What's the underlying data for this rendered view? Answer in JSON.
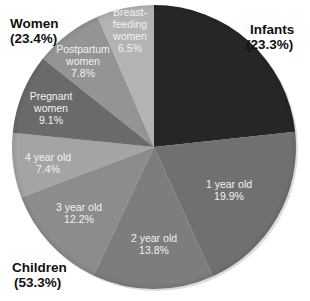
{
  "chart_data": {
    "type": "pie",
    "title": "",
    "start_angle": "12 o'clock, clockwise",
    "slices": [
      {
        "label": "Infants",
        "value": 23.3,
        "color": "#262626",
        "label_lines": [],
        "label_pos": [
          0,
          0
        ]
      },
      {
        "label": "1 year old",
        "value": 19.9,
        "color": "#707070",
        "label_lines": [
          "1 year old",
          "19.9%"
        ],
        "label_pos": [
          229,
          190
        ]
      },
      {
        "label": "2 year old",
        "value": 13.8,
        "color": "#7d7d7d",
        "label_lines": [
          "2 year old",
          "13.8%"
        ],
        "label_pos": [
          154,
          244
        ]
      },
      {
        "label": "3 year old",
        "value": 12.2,
        "color": "#8c8c8c",
        "label_lines": [
          "3 year old",
          "12.2%"
        ],
        "label_pos": [
          79,
          213
        ]
      },
      {
        "label": "4 year old",
        "value": 7.4,
        "color": "#a4a4a4",
        "label_lines": [
          "4 year old",
          "7.4%"
        ],
        "label_pos": [
          48,
          163
        ]
      },
      {
        "label": "Pregnant women",
        "value": 9.1,
        "color": "#6a6a6a",
        "label_lines": [
          "Pregnant",
          "women",
          "9.1%"
        ],
        "label_pos": [
          51,
          108
        ]
      },
      {
        "label": "Postpartum women",
        "value": 7.8,
        "color": "#949494",
        "label_lines": [
          "Postpartum",
          "women",
          "7.8%"
        ],
        "label_pos": [
          83,
          61
        ]
      },
      {
        "label": "Breastfeeding women",
        "value": 6.5,
        "color": "#b3b3b3",
        "label_lines": [
          "Breast-",
          "feeding",
          "women",
          "6.5%"
        ],
        "label_pos": [
          130,
          30
        ]
      }
    ],
    "groups": [
      {
        "label": "Women",
        "percent": "(23.4%)",
        "members": [
          "Pregnant women",
          "Postpartum women",
          "Breastfeeding women"
        ]
      },
      {
        "label": "Infants",
        "percent": "(23.3%)",
        "members": [
          "Infants"
        ]
      },
      {
        "label": "Children",
        "percent": "(53.3%)",
        "members": [
          "1 year old",
          "2 year old",
          "3 year old",
          "4 year old"
        ]
      }
    ],
    "legend": "none"
  },
  "groups": {
    "women": {
      "name": "Women",
      "pct": "(23.4%)"
    },
    "infants": {
      "name": "Infants",
      "pct": "(23.3%)"
    },
    "children": {
      "name": "Children",
      "pct": "(53.3%)"
    }
  }
}
